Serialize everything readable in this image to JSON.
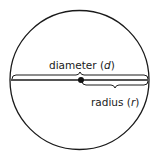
{
  "diagram": {
    "labels": {
      "diameter": {
        "word": "diameter",
        "open": "(",
        "symbol": "d",
        "close": ")"
      },
      "radius": {
        "word": "radius",
        "open": "(",
        "symbol": "r",
        "close": ")"
      }
    },
    "colors": {
      "stroke": "#1a1a1a",
      "background": "#ffffff"
    }
  }
}
